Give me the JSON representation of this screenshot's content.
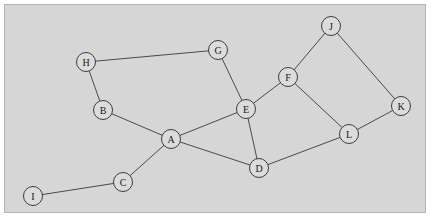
{
  "figure": {
    "kind": "undirected-graph-diagram",
    "panel": {
      "background_color": "#d6d6d6",
      "border_color": "#b4b4b4",
      "x": 4,
      "y": 4,
      "width": 422,
      "height": 209
    },
    "style": {
      "node_fill": "#dcdcdc",
      "node_stroke": "#3c3c3c",
      "node_radius": 9.5,
      "edge_color": "#4a4a4a",
      "edge_width": 1,
      "label_color": "#1a1a1a"
    }
  },
  "graph": {
    "node_count": 12,
    "edge_count": 15,
    "nodes": [
      {
        "id": "A",
        "label": "A",
        "x": 170,
        "y": 138
      },
      {
        "id": "B",
        "label": "B",
        "x": 102,
        "y": 109
      },
      {
        "id": "C",
        "label": "C",
        "x": 122,
        "y": 181
      },
      {
        "id": "D",
        "label": "D",
        "x": 258,
        "y": 167
      },
      {
        "id": "E",
        "label": "E",
        "x": 245,
        "y": 108
      },
      {
        "id": "F",
        "label": "F",
        "x": 287,
        "y": 76
      },
      {
        "id": "G",
        "label": "G",
        "x": 217,
        "y": 49
      },
      {
        "id": "H",
        "label": "H",
        "x": 85,
        "y": 61
      },
      {
        "id": "I",
        "label": "I",
        "x": 32,
        "y": 195
      },
      {
        "id": "J",
        "label": "J",
        "x": 330,
        "y": 25
      },
      {
        "id": "K",
        "label": "K",
        "x": 400,
        "y": 105
      },
      {
        "id": "L",
        "label": "L",
        "x": 348,
        "y": 133
      }
    ],
    "edges": [
      {
        "from": "H",
        "to": "G"
      },
      {
        "from": "H",
        "to": "B"
      },
      {
        "from": "B",
        "to": "A"
      },
      {
        "from": "G",
        "to": "E"
      },
      {
        "from": "A",
        "to": "E"
      },
      {
        "from": "A",
        "to": "D"
      },
      {
        "from": "A",
        "to": "C"
      },
      {
        "from": "C",
        "to": "I"
      },
      {
        "from": "E",
        "to": "F"
      },
      {
        "from": "E",
        "to": "D"
      },
      {
        "from": "D",
        "to": "L"
      },
      {
        "from": "F",
        "to": "J"
      },
      {
        "from": "F",
        "to": "L"
      },
      {
        "from": "J",
        "to": "K"
      },
      {
        "from": "K",
        "to": "L"
      }
    ]
  }
}
